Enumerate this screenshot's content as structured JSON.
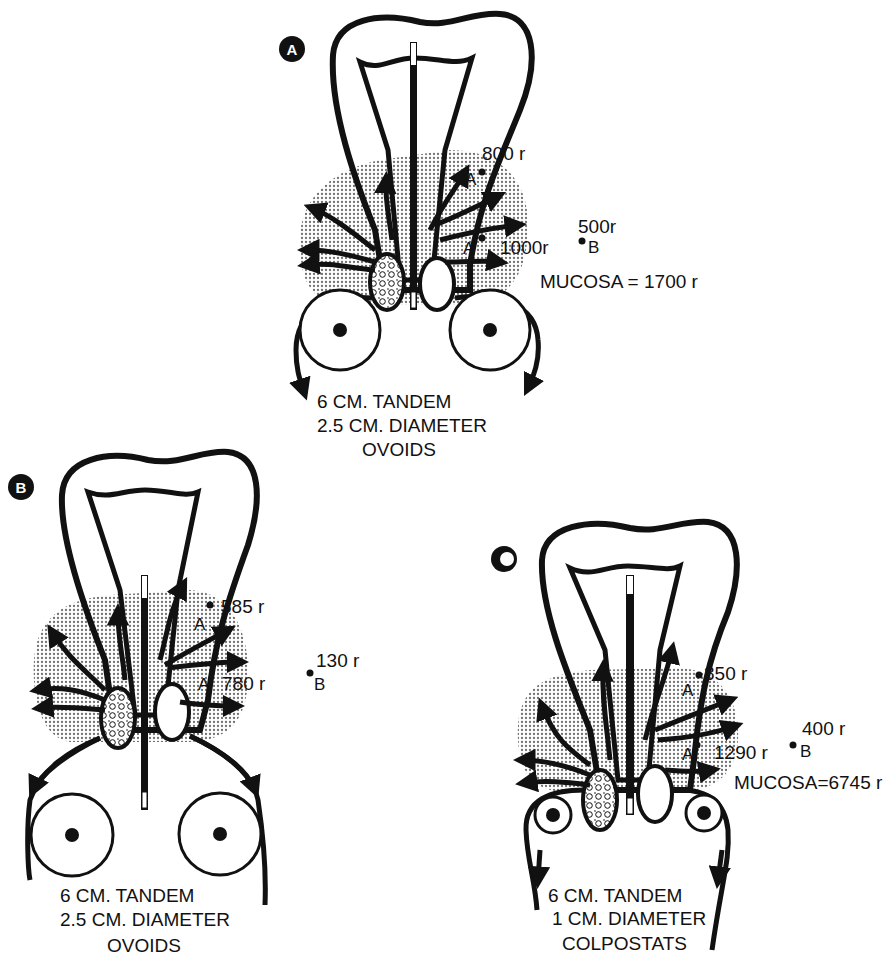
{
  "figure": {
    "colors": {
      "ink": "#111111",
      "paper": "#ffffff",
      "stipple": "#9a9a9a"
    },
    "panels": [
      {
        "id": "A",
        "badge": "A",
        "point_a_upper": {
          "label": "A",
          "dose": "800 r"
        },
        "point_a_lower": {
          "label": "A",
          "dose": "1000r"
        },
        "point_b": {
          "label": "B",
          "dose": "500r"
        },
        "mucosa": "MUCOSA = 1700 r",
        "caption": [
          "6 CM. TANDEM",
          "2.5 CM. DIAMETER",
          "OVOIDS"
        ],
        "applicator": "ovoids"
      },
      {
        "id": "B",
        "badge": "B",
        "point_a_upper": {
          "label": "A",
          "dose": "585 r"
        },
        "point_a_lower": {
          "label": "A",
          "dose": "780 r"
        },
        "point_b": {
          "label": "B",
          "dose": "130 r"
        },
        "mucosa": "",
        "caption": [
          "6 CM. TANDEM",
          "2.5 CM. DIAMETER",
          "OVOIDS"
        ],
        "applicator": "ovoids"
      },
      {
        "id": "C",
        "badge": "C",
        "point_a_upper": {
          "label": "A",
          "dose": "850 r"
        },
        "point_a_lower": {
          "label": "A",
          "dose": "1290 r"
        },
        "point_b": {
          "label": "B",
          "dose": "400 r"
        },
        "mucosa": "MUCOSA=6745 r",
        "caption": [
          "6 CM. TANDEM",
          "1 CM. DIAMETER",
          "COLPOSTATS"
        ],
        "applicator": "colpostats"
      }
    ]
  }
}
